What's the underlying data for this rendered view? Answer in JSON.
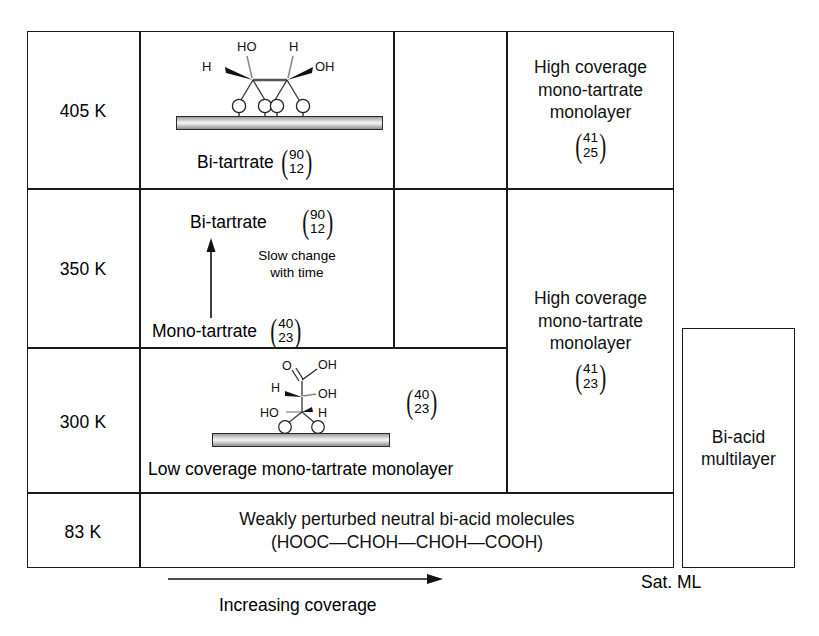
{
  "diagram": {
    "axis": {
      "x_label": "Increasing coverage",
      "x_end_label": "Sat. ML"
    },
    "temperatures": [
      {
        "id": "t405",
        "label": "405 K"
      },
      {
        "id": "t350",
        "label": "350 K"
      },
      {
        "id": "t300",
        "label": "300 K"
      },
      {
        "id": "t83",
        "label": "83 K"
      }
    ],
    "cells": {
      "t405_mid": {
        "species_label": "Bi-tartrate",
        "matrix_top": "90",
        "matrix_bottom": "12",
        "molecule": "bi-tartrate-on-surface"
      },
      "t405_right": {
        "text": "High coverage\nmono-tartrate\nmonolayer",
        "matrix_top": "41",
        "matrix_bottom": "25"
      },
      "t350_mid": {
        "product_label": "Bi-tartrate",
        "product_matrix_top": "90",
        "product_matrix_bottom": "12",
        "reactant_label": "Mono-tartrate",
        "reactant_matrix_top": "40",
        "reactant_matrix_bottom": "23",
        "transition_note": "Slow change\nwith time"
      },
      "t300_right_span": {
        "text": "High coverage\nmono-tartrate\nmonolayer",
        "matrix_top": "41",
        "matrix_bottom": "23"
      },
      "t300_mid": {
        "caption": "Low coverage mono-tartrate monolayer",
        "matrix_top": "40",
        "matrix_bottom": "23",
        "molecule": "mono-tartrate-on-surface"
      },
      "t83_span": {
        "line1": "Weakly perturbed neutral bi-acid molecules",
        "line2": "(HOOC—CHOH—CHOH—COOH)"
      },
      "multilayer": {
        "text": "Bi-acid\nmultilayer"
      }
    },
    "molecule_atoms": {
      "bi_tartrate": [
        "HO",
        "H",
        "H",
        "OH",
        "O",
        "O",
        "O",
        "O"
      ],
      "mono_tartrate": [
        "O",
        "OH",
        "H",
        "OH",
        "HO",
        "H",
        "O",
        "O"
      ]
    },
    "colors": {
      "line": "#1a1a1a",
      "text": "#111111",
      "slab_light": "#f4f4f4",
      "slab_dark": "#8f8f8f"
    }
  }
}
